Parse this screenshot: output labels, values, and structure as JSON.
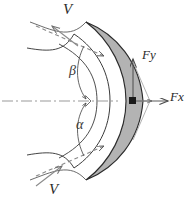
{
  "figure": {
    "name": "jet-impinging-on-curved-vane-force-diagram",
    "labels": {
      "velocity_top": "V",
      "velocity_bottom": "V",
      "force_y": "Fy",
      "force_x": "Fx",
      "angle_beta": "β",
      "angle_alpha": "α"
    },
    "colors": {
      "vane_fill": "#b3b3b3",
      "outline": "#2b2b2b",
      "jet_line": "#6e6e6e",
      "axis": "#9a9a9a",
      "force_line": "#5a5a5a",
      "marker": "#1a1a1a",
      "background": "#ffffff"
    },
    "elements": {
      "centerline_style": "dash-dot",
      "vane_shape": "crescent",
      "jet_inlet_top_direction": "down-right",
      "jet_outlet_top_direction": "up-left",
      "jet_inlet_bottom_direction": "up-right",
      "force_triangle": "resultant-components-at-vane-vertex"
    }
  }
}
